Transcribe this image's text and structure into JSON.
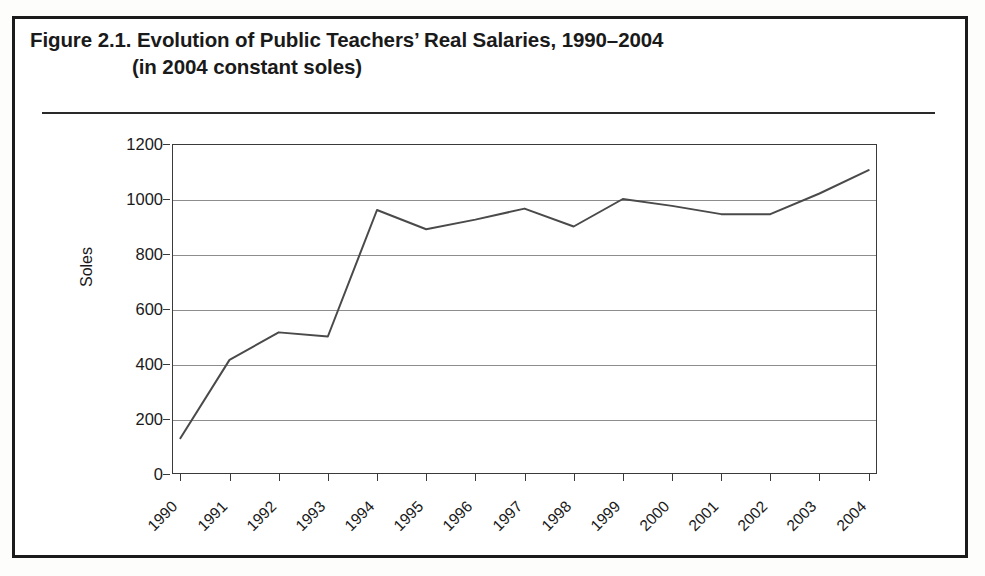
{
  "figure": {
    "title_line_1": "Figure 2.1.  Evolution of Public Teachers’ Real Salaries, 1990–2004",
    "title_line_2": "(in 2004 constant soles)",
    "frame_color": "#1b1b1b",
    "rule_color": "#2a2a2a"
  },
  "chart_data": {
    "type": "line",
    "title": "Evolution of Public Teachers’ Real Salaries, 1990–2004 (in 2004 constant soles)",
    "xlabel": "",
    "ylabel": "Soles",
    "categories": [
      "1990",
      "1991",
      "1992",
      "1993",
      "1994",
      "1995",
      "1996",
      "1997",
      "1998",
      "1999",
      "2000",
      "2001",
      "2002",
      "2003",
      "2004"
    ],
    "values": [
      130,
      415,
      515,
      500,
      960,
      890,
      925,
      965,
      900,
      1000,
      975,
      945,
      945,
      1020,
      1105
    ],
    "series": [
      {
        "name": "Real salary",
        "values": [
          130,
          415,
          515,
          500,
          960,
          890,
          925,
          965,
          900,
          1000,
          975,
          945,
          945,
          1020,
          1105
        ],
        "color": "#4a4a4a"
      }
    ],
    "ylim": [
      0,
      1200
    ],
    "yticks": [
      0,
      200,
      400,
      600,
      800,
      1000,
      1200
    ],
    "ytick_labels": [
      "0",
      "200",
      "400",
      "600",
      "800",
      "1000",
      "1200"
    ],
    "grid": true,
    "grid_color": "#8d8d8d",
    "legend": "none",
    "legend_position": "none",
    "axis_color": "#3a3a3a",
    "line_color": "#4a4a4a",
    "markers": false,
    "xtick_rotation": -45
  }
}
